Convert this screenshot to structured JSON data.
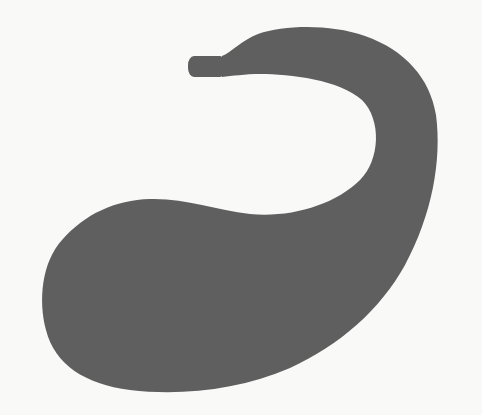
{
  "scene": {
    "description": "Dark gray silhouette of a curved gourd/stomach-like shape with a short tube at the top-left end, on an off-white background",
    "colors": {
      "background": "#f9f9f8",
      "shape": "#5f5f5f"
    }
  }
}
